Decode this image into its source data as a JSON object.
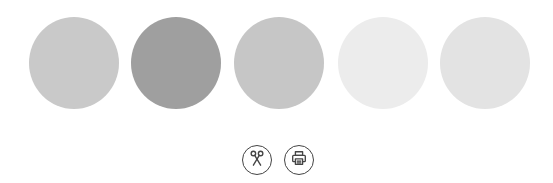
{
  "swatches": [
    {
      "name": "swatch-1",
      "color": "#c9c9c9",
      "x": 29
    },
    {
      "name": "swatch-2",
      "color": "#9f9f9f",
      "x": 131
    },
    {
      "name": "swatch-3",
      "color": "#c6c6c6",
      "x": 234
    },
    {
      "name": "swatch-4",
      "color": "#ececec",
      "x": 338
    },
    {
      "name": "swatch-5",
      "color": "#e3e3e3",
      "x": 440
    }
  ],
  "actions": [
    {
      "name": "cut-button",
      "icon": "scissors-icon"
    },
    {
      "name": "print-button",
      "icon": "printer-icon"
    }
  ]
}
